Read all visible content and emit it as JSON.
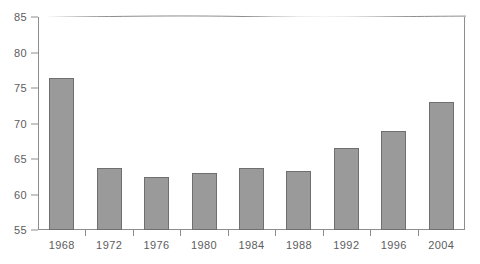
{
  "chart_data": {
    "type": "bar",
    "title": "",
    "subtitle": "",
    "xlabel": "",
    "ylabel": "",
    "categories": [
      "1968",
      "1972",
      "1976",
      "1980",
      "1984",
      "1988",
      "1992",
      "1996",
      "2004"
    ],
    "values": [
      76.4,
      63.8,
      62.5,
      63.0,
      63.7,
      63.3,
      66.5,
      68.9,
      73.1
    ],
    "ylim": [
      55,
      85
    ],
    "yticks": [
      55,
      60,
      65,
      70,
      75,
      80,
      85
    ],
    "ytick_labels": [
      "55",
      "60",
      "65",
      "70",
      "75",
      "80",
      "85"
    ],
    "grid": false,
    "legend": null,
    "legend_position": "none",
    "bar_color": "#9a9a9a",
    "bar_border_color": "#6f6f6f",
    "axis_color": "#8d8d8d",
    "tick_label_color": "#5d5d5d",
    "background_color": "#ffffff"
  }
}
